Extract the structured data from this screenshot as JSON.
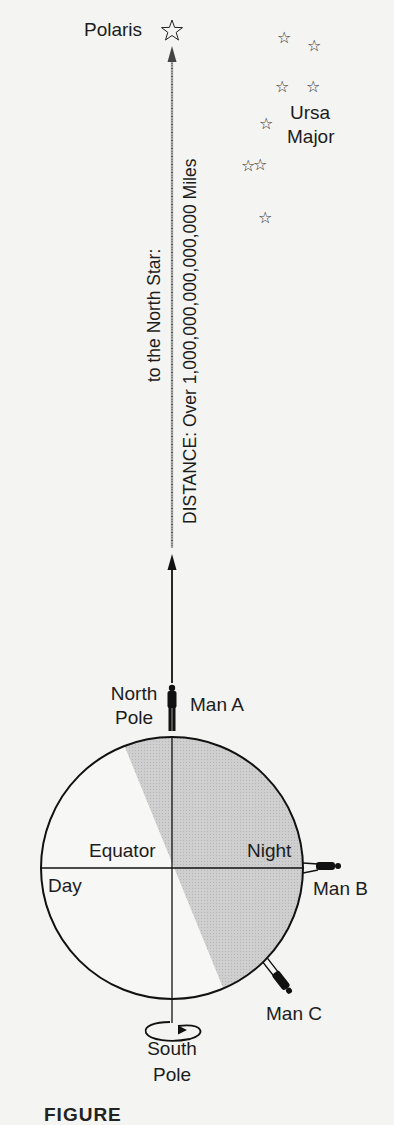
{
  "figure": {
    "polaris_label": "Polaris",
    "constellation_label_line1": "Ursa",
    "constellation_label_line2": "Major",
    "arrow_label_left": "to the North Star:",
    "arrow_label_right": "DISTANCE: Over 1,000,000,000,000,000 Miles",
    "north_pole_line1": "North",
    "north_pole_line2": "Pole",
    "south_pole_line1": "South",
    "south_pole_line2": "Pole",
    "equator_label": "Equator",
    "day_label": "Day",
    "night_label": "Night",
    "man_a_label": "Man A",
    "man_b_label": "Man B",
    "man_c_label": "Man C",
    "caption_partial": "FIGURE"
  },
  "icons": {
    "star": "☆"
  },
  "stars": [
    {
      "name": "ursa-major-star-1",
      "x": 285,
      "y": 39
    },
    {
      "name": "ursa-major-star-2",
      "x": 315,
      "y": 47
    },
    {
      "name": "ursa-major-star-3",
      "x": 283,
      "y": 88
    },
    {
      "name": "ursa-major-star-4",
      "x": 314,
      "y": 88
    },
    {
      "name": "ursa-major-star-5",
      "x": 267,
      "y": 125
    },
    {
      "name": "ursa-major-star-6",
      "x": 249,
      "y": 167
    },
    {
      "name": "ursa-major-star-7",
      "x": 261,
      "y": 166
    },
    {
      "name": "ursa-major-star-8",
      "x": 266,
      "y": 219
    }
  ],
  "colors": {
    "background": "#f4f4f2",
    "ink": "#1a1a1a",
    "night_shade": "#c9c9c9"
  }
}
